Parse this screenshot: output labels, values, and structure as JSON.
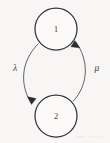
{
  "figure": {
    "background_color": "#f7f6f4",
    "stroke_color": "#5a585f",
    "node_stroke_color": "#34323a",
    "label_color": "#45434a"
  },
  "diagram_data": {
    "type": "state-transition-graph",
    "nodes": [
      {
        "id": "1",
        "label": "1",
        "cx": 56,
        "cy": 29,
        "r": 21
      },
      {
        "id": "2",
        "label": "2",
        "cx": 56,
        "cy": 116,
        "r": 21
      }
    ],
    "edges": [
      {
        "id": "edge-lambda",
        "label": "λ",
        "label_text": "lambda",
        "from": "1",
        "to": "2",
        "side": "left",
        "arrow_at": "2",
        "path": "M 38.5 43.5 C 20 62, 20 86, 31.5 103.5",
        "arrow_points": "31.5,104.5 27.4,96.6 36.2,98.6",
        "label_x": 15,
        "label_y": 69
      },
      {
        "id": "edge-mu",
        "label": "μ",
        "label_text": "mu",
        "from": "2",
        "to": "1",
        "side": "right",
        "arrow_at": "1",
        "path": "M 73 101.5 C 89 84, 89 60, 75.5 41.5",
        "arrow_points": "74.8,40.6 79.8,47.9 70.8,46.8",
        "label_x": 97,
        "label_y": 69
      }
    ]
  }
}
